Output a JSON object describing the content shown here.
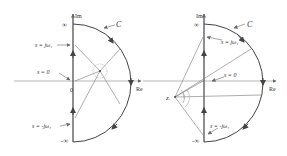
{
  "figure": {
    "left": {
      "axis_labels": {
        "im": "Im",
        "re": "Re",
        "inf_top": "∞",
        "inf_bottom": "-∞",
        "origin": "0"
      },
      "contour_label": "C",
      "point_labels": {
        "jw_pos": "s = jω₁",
        "zero": "s = 0",
        "jw_neg": "s = -jω₁"
      }
    },
    "right": {
      "axis_labels": {
        "im": "Im",
        "re": "Re",
        "inf_top": "∞",
        "inf_bottom": "-∞"
      },
      "contour_label": "C",
      "pole_label": "zᵢ",
      "point_labels": {
        "jw_pos": "s = jω₁",
        "zero": "s = 0",
        "jw_neg": "s = -jω₁"
      }
    }
  }
}
